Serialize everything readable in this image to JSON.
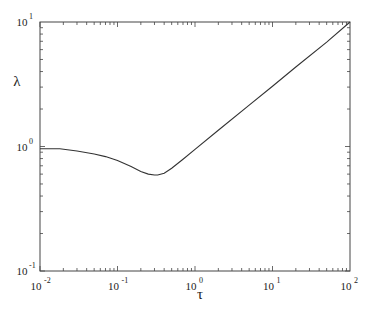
{
  "chart_data": {
    "type": "line",
    "title": "",
    "xlabel": "τ",
    "ylabel": "λ",
    "xscale": "log",
    "yscale": "log",
    "xlim": [
      0.01,
      100
    ],
    "ylim": [
      0.1,
      10
    ],
    "grid": false,
    "legend": null,
    "x_ticks": [
      {
        "base": "10",
        "exp": "-2",
        "value": 0.01
      },
      {
        "base": "10",
        "exp": "-1",
        "value": 0.1
      },
      {
        "base": "10",
        "exp": "0",
        "value": 1
      },
      {
        "base": "10",
        "exp": "1",
        "value": 10
      },
      {
        "base": "10",
        "exp": "2",
        "value": 100
      }
    ],
    "y_ticks": [
      {
        "base": "10",
        "exp": "-1",
        "value": 0.1
      },
      {
        "base": "10",
        "exp": "0",
        "value": 1
      },
      {
        "base": "10",
        "exp": "1",
        "value": 10
      }
    ],
    "series": [
      {
        "name": "λ(τ)",
        "color": "#333333",
        "x": [
          0.01,
          0.018,
          0.03,
          0.05,
          0.07,
          0.1,
          0.15,
          0.2,
          0.25,
          0.3,
          0.33,
          0.4,
          0.5,
          0.7,
          1,
          2,
          5,
          10,
          20,
          50,
          100
        ],
        "y": [
          0.96,
          0.96,
          0.92,
          0.87,
          0.83,
          0.77,
          0.69,
          0.63,
          0.6,
          0.59,
          0.59,
          0.61,
          0.67,
          0.79,
          0.95,
          1.35,
          2.15,
          3.05,
          4.35,
          6.9,
          10.0
        ]
      }
    ]
  }
}
